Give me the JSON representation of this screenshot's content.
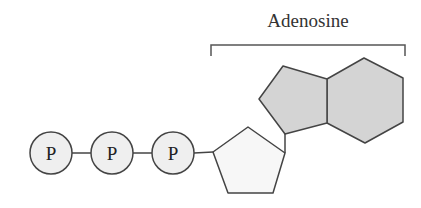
{
  "diagram": {
    "title_label": "Adenosine",
    "phosphates": [
      {
        "label": "P",
        "cx": 51,
        "cy": 153
      },
      {
        "label": "P",
        "cx": 112,
        "cy": 153
      },
      {
        "label": "P",
        "cx": 173,
        "cy": 153
      }
    ],
    "phosphate_radius": 21,
    "colors": {
      "stroke": "#444444",
      "phosphate_fill": "#efefef",
      "ribose_fill": "#f7f7f7",
      "base_fill": "#d4d4d4",
      "bracket": "#555555"
    }
  }
}
